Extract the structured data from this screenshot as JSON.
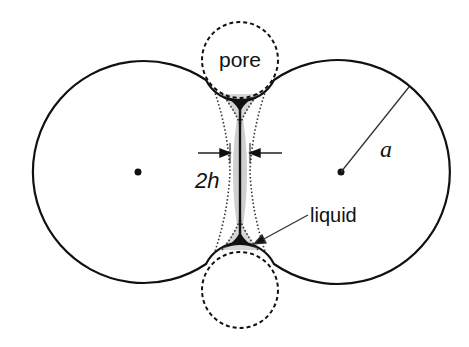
{
  "figure": {
    "labels": {
      "pore": "pore",
      "gap": "2h",
      "radius": "a",
      "liquid": "liquid"
    },
    "colors": {
      "outline": "#111111",
      "liquid_fill": "#cfcfcf",
      "meniscus_fill": "#111111",
      "background": "#ffffff"
    },
    "geometry": {
      "left_sphere": {
        "cx": 138,
        "cy": 172,
        "r": 111
      },
      "right_sphere": {
        "cx": 341,
        "cy": 172,
        "r": 112
      },
      "top_pore": {
        "cx": 240,
        "cy": 60,
        "r": 38
      },
      "bottom_pore": {
        "cx": 240,
        "cy": 290,
        "r": 38
      }
    }
  }
}
